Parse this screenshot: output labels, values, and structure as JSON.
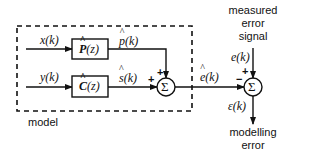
{
  "diagram": {
    "model_label": "model",
    "blocks": [
      {
        "id": "P",
        "label_main": "P",
        "label_arg": "(z)",
        "hat": true
      },
      {
        "id": "C",
        "label_main": "C",
        "label_arg": "(z)",
        "hat": true
      }
    ],
    "signals": {
      "x": {
        "main": "x",
        "arg": "(k)"
      },
      "y": {
        "main": "y",
        "arg": "(k)"
      },
      "p_hat": {
        "main": "p",
        "arg": "(k)",
        "hat": true
      },
      "s_hat": {
        "main": "s",
        "arg": "(k)",
        "hat": true
      },
      "e_hat": {
        "main": "e",
        "arg": "(k)",
        "hat": true
      },
      "e": {
        "main": "e",
        "arg": "(k)"
      },
      "eps": {
        "main": "ε",
        "arg": "(k)"
      }
    },
    "summers": [
      {
        "id": "sum1",
        "symbol": "Σ",
        "inputs": [
          {
            "from": "p_hat",
            "sign": "+"
          },
          {
            "from": "s_hat",
            "sign": "+"
          }
        ]
      },
      {
        "id": "sum2",
        "symbol": "Σ",
        "inputs": [
          {
            "from": "e",
            "sign": "+"
          },
          {
            "from": "e_hat",
            "sign": "−"
          }
        ]
      }
    ],
    "measured_label": [
      "measured",
      "error",
      "signal"
    ],
    "output_label": [
      "modelling",
      "error"
    ]
  }
}
